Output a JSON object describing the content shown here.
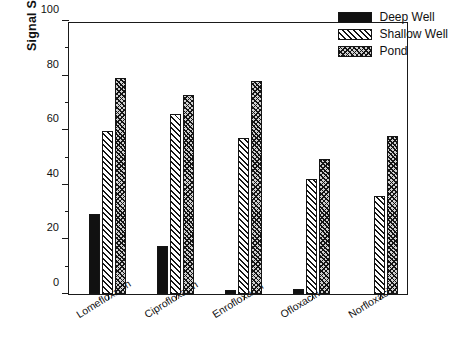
{
  "figure": {
    "top_cropped_text": "",
    "background": "#ffffff",
    "ink": "#111111"
  },
  "chart_data": {
    "type": "bar",
    "title": "",
    "xlabel": "",
    "ylabel": "Signal Suppression (%)",
    "categories": [
      "Lomefloxacin",
      "Ciprofloxacin",
      "Enrofloxacin",
      "Ofloxacin",
      "Norfloxacin"
    ],
    "series": [
      {
        "name": "Deep Well",
        "fill": "solid",
        "color": "#111111",
        "values": [
          29.3,
          17.6,
          1.5,
          2.0,
          0.0
        ]
      },
      {
        "name": "Shallow Well",
        "fill": "diagonal",
        "color": "#111111",
        "values": [
          59.7,
          66.0,
          57.0,
          42.0,
          36.0
        ]
      },
      {
        "name": "Pond",
        "fill": "crosshatch",
        "color": "#111111",
        "values": [
          79.0,
          73.0,
          78.0,
          49.5,
          58.0
        ]
      }
    ],
    "ylim": [
      0,
      100
    ],
    "yticks": [
      0,
      20,
      40,
      60,
      80,
      100
    ],
    "ytick_labels": [
      "0",
      "20",
      "40",
      "60",
      "80",
      "100"
    ],
    "yminor_ticks": [
      10,
      30,
      50,
      70,
      90
    ],
    "grid": false,
    "legend_position": "top-right"
  }
}
